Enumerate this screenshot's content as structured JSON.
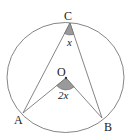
{
  "diagram": {
    "colors": {
      "stroke": "#777777",
      "angle_fill": "#9a9a9a",
      "text": "#222222"
    },
    "points": {
      "C": {
        "label": "C",
        "x": 70,
        "y": 23
      },
      "O": {
        "label": "O",
        "x": 66,
        "y": 78
      },
      "A": {
        "label": "A",
        "x": 23,
        "y": 113
      },
      "B": {
        "label": "B",
        "x": 102,
        "y": 118
      }
    },
    "angles": {
      "inscribed": {
        "vertex": "C",
        "label": "x"
      },
      "central": {
        "vertex": "O",
        "label": "2x"
      }
    }
  }
}
